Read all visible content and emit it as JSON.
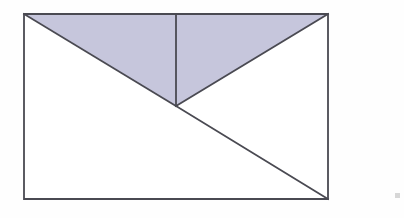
{
  "figure": {
    "canvas": {
      "width": 404,
      "height": 218,
      "background": "#fefefe"
    },
    "style": {
      "stroke_color": "#4a4a52",
      "stroke_width": 1.8,
      "shaded_fill": "#c6c6dc",
      "unshaded_fill": "#ffffff"
    },
    "points": {
      "top_left": {
        "x": 24,
        "y": 14
      },
      "top_right": {
        "x": 328,
        "y": 14
      },
      "bottom_right": {
        "x": 328,
        "y": 199
      },
      "bottom_left": {
        "x": 24,
        "y": 199
      },
      "top_midpoint": {
        "x": 176,
        "y": 14
      },
      "center_apex": {
        "x": 176,
        "y": 106
      }
    },
    "rectangle": {
      "label": "outer-rectangle",
      "path": "M 24 14 L 328 14 L 328 199 L 24 199 Z",
      "fill": "#ffffff"
    },
    "shaded_triangle": {
      "label": "shaded-triangle",
      "description": "Triangle from top-left corner to top-right corner to rectangle center",
      "path": "M 24 14 L 328 14 L 176 106 Z",
      "fill": "#c6c6dc"
    },
    "segments": [
      {
        "name": "left-upper-diagonal",
        "x1": 24,
        "y1": 14,
        "x2": 176,
        "y2": 106
      },
      {
        "name": "right-upper-diagonal",
        "x1": 328,
        "y1": 14,
        "x2": 176,
        "y2": 106
      },
      {
        "name": "vertical-median",
        "x1": 176,
        "y1": 14,
        "x2": 176,
        "y2": 106
      },
      {
        "name": "lower-diagonal",
        "x1": 176,
        "y1": 106,
        "x2": 328,
        "y2": 199
      }
    ],
    "artifact": {
      "name": "scan-speck",
      "x": 395,
      "y": 193,
      "width": 5,
      "height": 5,
      "color": "#d7d7d7"
    }
  }
}
